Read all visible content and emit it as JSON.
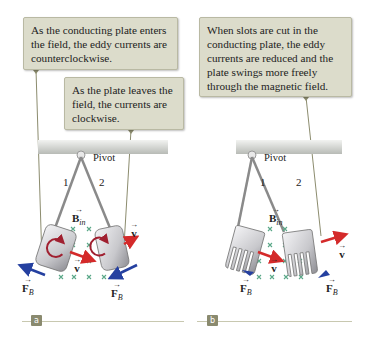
{
  "panels": [
    {
      "tag": "a",
      "callouts": [
        {
          "text": "As the conducting plate enters the field, the eddy currents are counterclockwise."
        },
        {
          "text": "As the plate leaves the field, the currents are clockwise."
        }
      ],
      "pivot_label": "Pivot",
      "position_labels": [
        "1",
        "2"
      ],
      "field_label": "B",
      "field_sub": "in",
      "velocity_label": "v",
      "force_label": "F",
      "force_sub": "B"
    },
    {
      "tag": "b",
      "callouts": [
        {
          "text": "When slots are cut in the conducting plate, the eddy currents are reduced and the plate swings more freely through the magnetic field."
        }
      ],
      "pivot_label": "Pivot",
      "position_labels": [
        "1",
        "2"
      ],
      "field_label": "B",
      "field_sub": "in",
      "velocity_label": "v",
      "force_label": "F",
      "force_sub": "B"
    }
  ],
  "colors": {
    "callout_bg": "#dcdccb",
    "velocity_arrow": "#d42a2a",
    "force_arrow": "#2540a0",
    "field_marks": "#5aa888",
    "eddy_current": "#a02030",
    "tag_bg": "#8a8a6f"
  }
}
